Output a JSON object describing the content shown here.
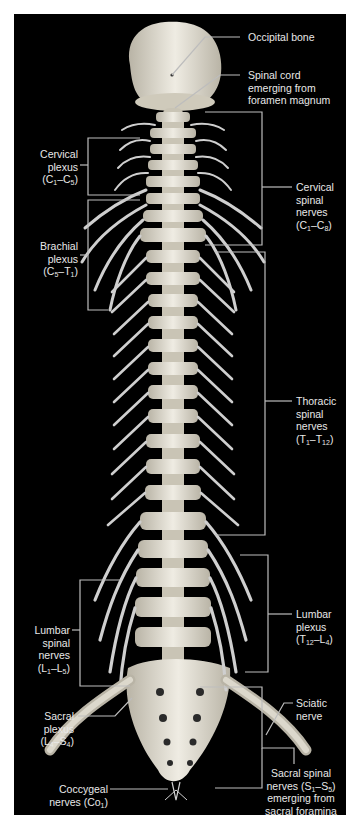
{
  "figure": {
    "background": "#000000",
    "label_color": "#e8e8e8",
    "bone_color": "#e6e2d6",
    "nerve_color": "#cfcfcf",
    "leader_color": "#bdbdbd"
  },
  "labels": {
    "occipital_bone": "Occipital bone",
    "spinal_cord": [
      "Spinal cord",
      "emerging from",
      "foramen magnum"
    ],
    "cervical_plexus": [
      "Cervical",
      "plexus",
      "(C",
      "1",
      "–C",
      "5",
      ")"
    ],
    "brachial_plexus": [
      "Brachial",
      "plexus",
      "(C",
      "5",
      "–T",
      "1",
      ")"
    ],
    "cervical_spinal_nerves": [
      "Cervical",
      "spinal",
      "nerves",
      "(C",
      "1",
      "–C",
      "8",
      ")"
    ],
    "thoracic_spinal_nerves": [
      "Thoracic",
      "spinal",
      "nerves",
      "(T",
      "1",
      "–T",
      "12",
      ")"
    ],
    "lumbar_plexus": [
      "Lumbar",
      "plexus",
      "(T",
      "12",
      "–L",
      "4",
      ")"
    ],
    "lumbar_spinal_nerves": [
      "Lumbar",
      "spinal",
      "nerves",
      "(L",
      "1",
      "–L",
      "5",
      ")"
    ],
    "sciatic_nerve": [
      "Sciatic",
      "nerve"
    ],
    "sacral_plexus": [
      "Sacral",
      "plexus",
      "(L",
      "4",
      "–S",
      "4",
      ")"
    ],
    "sacral_spinal_nerves": [
      "Sacral spinal",
      "nerves (S",
      "1",
      "–S",
      "5",
      ")",
      "emerging from",
      "sacral foramina"
    ],
    "coccygeal_nerves": [
      "Coccygeal",
      "nerves (Co",
      "1",
      ")"
    ]
  }
}
